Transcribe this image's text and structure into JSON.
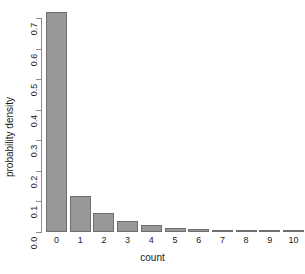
{
  "chart_data": {
    "type": "bar",
    "title": "",
    "xlabel": "count",
    "ylabel": "probability density",
    "categories": [
      "0",
      "1",
      "2",
      "3",
      "4",
      "5",
      "6",
      "7",
      "8",
      "9",
      "10"
    ],
    "values": [
      0.72,
      0.118,
      0.062,
      0.036,
      0.023,
      0.013,
      0.011,
      0.008,
      0.007,
      0.005,
      0.004
    ],
    "ylim": [
      0.0,
      0.73
    ],
    "xlim": [
      0,
      11
    ],
    "ytick_labels": [
      "0.0",
      "0.1",
      "0.2",
      "0.3",
      "0.4",
      "0.5",
      "0.6",
      "0.7"
    ],
    "ytick_values": [
      0.0,
      0.1,
      0.2,
      0.3,
      0.4,
      0.5,
      0.6,
      0.7
    ],
    "xtick_labels": [
      "0",
      "1",
      "2",
      "3",
      "4",
      "5",
      "6",
      "7",
      "8",
      "9",
      "10"
    ],
    "grid": false,
    "legend": null,
    "bar_fill_color": "#989898",
    "bar_border_color": "#6f6f6f",
    "axis_color": "#8d8d8d",
    "text_color": "#1a1a1a",
    "background_color": "#ffffff"
  }
}
